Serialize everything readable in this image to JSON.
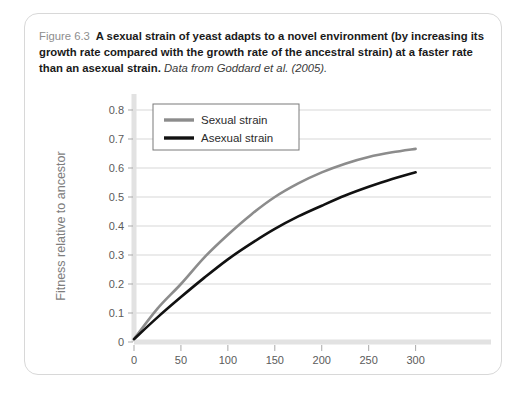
{
  "figure": {
    "label": "Figure 6.3",
    "caption_text": "A sexual strain of yeast adapts to a novel environment (by increasing its growth rate compared with the growth rate of the ancestral strain) at a faster rate than an asexual strain.",
    "source": "Data from Goddard et al. (2005)."
  },
  "colors": {
    "sexual": "#8c8c8c",
    "asexual": "#111111",
    "gridline": "#d7d7d7",
    "axis": "#cfcfcf",
    "card_border": "#d8d8d8",
    "label_gray": "#7d7d7d"
  },
  "chart_data": {
    "type": "line",
    "title": "",
    "xlabel": "Generations evolving",
    "ylabel": "Fitness relative to ancestor",
    "xlim": [
      0,
      310
    ],
    "ylim": [
      0,
      0.8
    ],
    "xticks": [
      "0",
      "50",
      "100",
      "150",
      "200",
      "250",
      "300"
    ],
    "xtick_values": [
      0,
      50,
      100,
      150,
      200,
      250,
      300
    ],
    "yticks": [
      "0",
      "0.1",
      "0.2",
      "0.3",
      "0.4",
      "0.5",
      "0.6",
      "0.7",
      "0.8"
    ],
    "ytick_values": [
      0,
      0.1,
      0.2,
      0.3,
      0.4,
      0.5,
      0.6,
      0.7,
      0.8
    ],
    "grid": "horizontal",
    "legend_position": "top-left-inside",
    "x": [
      0,
      25,
      50,
      75,
      100,
      125,
      150,
      175,
      200,
      225,
      250,
      275,
      300
    ],
    "series": [
      {
        "name": "Sexual strain",
        "color": "#8c8c8c",
        "values": [
          0.01,
          0.115,
          0.2,
          0.292,
          0.37,
          0.44,
          0.5,
          0.547,
          0.585,
          0.615,
          0.638,
          0.654,
          0.666
        ]
      },
      {
        "name": "Asexual strain",
        "color": "#111111",
        "values": [
          0.01,
          0.085,
          0.155,
          0.222,
          0.285,
          0.34,
          0.39,
          0.433,
          0.47,
          0.505,
          0.535,
          0.562,
          0.585
        ]
      }
    ]
  }
}
